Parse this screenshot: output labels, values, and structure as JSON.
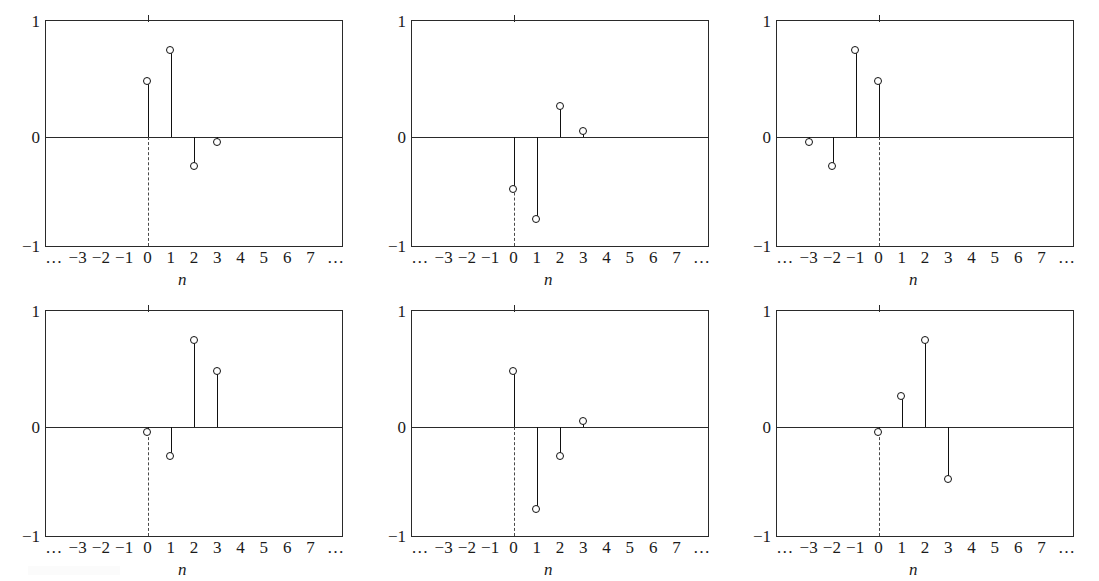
{
  "figure": {
    "axis_variable": "n",
    "y_ticks": [
      "1",
      "0",
      "−1"
    ],
    "x_ticks": [
      "…",
      "−3",
      "−2",
      "−1",
      "0",
      "1",
      "2",
      "3",
      "4",
      "5",
      "6",
      "7",
      "…"
    ],
    "x_tick_values": [
      null,
      -3,
      -2,
      -1,
      0,
      1,
      2,
      3,
      4,
      5,
      6,
      7,
      null
    ],
    "stem_color": "#111111",
    "axis_color": "#2a2a2a",
    "background": "#ffffff"
  },
  "chart_data": {
    "type": "scatter",
    "xlabel": "n",
    "ylabel": "",
    "ylim": [
      -1,
      1
    ],
    "xlim": [
      -4.4,
      8.4
    ],
    "grid": false,
    "legend": "none",
    "style": "stem plot (lollipop), open circle markers, dashed vertical line at n=0",
    "panels": [
      {
        "id": "panel-1",
        "title": "h₁(n)",
        "title_parts": [
          {
            "text": "h",
            "style": "italic"
          },
          {
            "text": "1",
            "style": "sub"
          },
          {
            "text": "(",
            "style": "italic"
          },
          {
            "text": "n",
            "style": "italic"
          },
          {
            "text": ")",
            "style": "italic"
          }
        ],
        "x": [
          0,
          1,
          2,
          3
        ],
        "y": [
          0.48,
          0.75,
          -0.27,
          -0.05
        ]
      },
      {
        "id": "panel-2",
        "title": "h₂(n) = −h₁(n)",
        "x": [
          0,
          1,
          2,
          3
        ],
        "y": [
          -0.48,
          -0.75,
          0.27,
          0.05
        ]
      },
      {
        "id": "panel-3",
        "title": "h₃(n) = h₁(−n)",
        "x": [
          -3,
          -2,
          -1,
          0
        ],
        "y": [
          -0.05,
          -0.27,
          0.75,
          0.48
        ]
      },
      {
        "id": "panel-4",
        "title": "h₄(n) = h₁(K − 1 − n)",
        "x": [
          0,
          1,
          2,
          3
        ],
        "y": [
          -0.05,
          -0.27,
          0.75,
          0.48
        ]
      },
      {
        "id": "panel-5",
        "title": "h₅(n) = (−1)ⁿh₁(n)",
        "x": [
          0,
          1,
          2,
          3
        ],
        "y": [
          0.48,
          -0.75,
          -0.27,
          0.05
        ]
      },
      {
        "id": "panel-6",
        "title": "h₆(n) = (−1)ⁿh₁(K − 1 − n)",
        "x": [
          0,
          1,
          2,
          3
        ],
        "y": [
          -0.05,
          0.27,
          0.75,
          -0.48
        ]
      }
    ]
  }
}
